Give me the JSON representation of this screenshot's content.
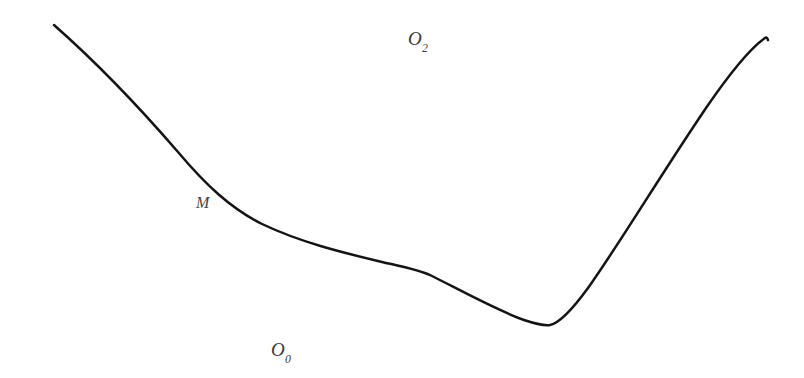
{
  "figure": {
    "background_color": "#ffffff",
    "width": 804,
    "height": 378,
    "curve": {
      "name": "boundary-curve",
      "color": "#141414",
      "stroke_width": 2.5,
      "description": "Smooth boundary curve descending from upper-left, flattening across the middle, dipping to a minimum, then rising steeply to the upper-right.",
      "start_point": [
        54,
        25
      ],
      "end_point": [
        767,
        38
      ],
      "minimum_point": [
        548,
        325
      ],
      "plateau_range": [
        260,
        430
      ],
      "path": "M 54,25 C 96,62 140,108 178,152 C 205,184 230,208 262,224 C 300,242 340,252 382,262 C 404,267 420,270 432,276 C 460,290 496,310 524,320 C 536,324 544,326 550,325 C 560,323 572,310 588,288 C 618,246 660,176 706,108 C 730,73 752,47 765,38 C 766,37 767,37 768,40"
    },
    "labels": {
      "region_upper": {
        "base": "O",
        "subscript": "2"
      },
      "region_lower": {
        "base": "O",
        "subscript": "0"
      },
      "curve_marker": {
        "text": "M"
      }
    }
  }
}
